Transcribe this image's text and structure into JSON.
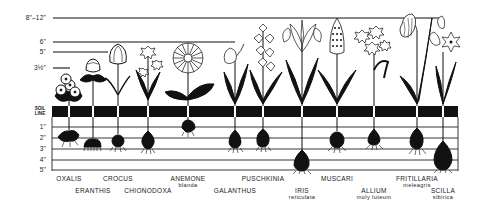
{
  "diagram": {
    "height_markers": [
      {
        "label": "8\"–12\"",
        "y": 18,
        "x_end": 443
      },
      {
        "label": "6\"",
        "y": 42,
        "x_end": 235
      },
      {
        "label": "5\"",
        "y": 52,
        "x_end": 108
      },
      {
        "label": "3½\"",
        "y": 68,
        "x_end": 70
      }
    ],
    "soil_line": {
      "label_line1": "SOIL",
      "label_line2": "LINE"
    },
    "depth_markers": [
      {
        "label": "1\"",
        "y": 127
      },
      {
        "label": "2\"",
        "y": 138
      },
      {
        "label": "3\"",
        "y": 149
      },
      {
        "label": "4\"",
        "y": 160
      },
      {
        "label": "5\"",
        "y": 170
      }
    ],
    "plants": [
      {
        "name": "OXALIS",
        "sub": "",
        "x": 69,
        "label_row": 1
      },
      {
        "name": "ERANTHIS",
        "sub": "",
        "x": 93,
        "label_row": 2
      },
      {
        "name": "CROCUS",
        "sub": "",
        "x": 118,
        "label_row": 1
      },
      {
        "name": "CHIONODOXA",
        "sub": "",
        "x": 148,
        "label_row": 2
      },
      {
        "name": "ANEMONE",
        "sub": "blanda",
        "x": 188,
        "label_row": 1
      },
      {
        "name": "GALANTHUS",
        "sub": "",
        "x": 235,
        "label_row": 2
      },
      {
        "name": "PUSCHKINIA",
        "sub": "",
        "x": 263,
        "label_row": 1
      },
      {
        "name": "IRIS",
        "sub": "reticulata",
        "x": 302,
        "label_row": 2
      },
      {
        "name": "MUSCARI",
        "sub": "",
        "x": 337,
        "label_row": 1
      },
      {
        "name": "ALLIUM",
        "sub": "moly luteum",
        "x": 374,
        "label_row": 2
      },
      {
        "name": "FRITILLARIA",
        "sub": "meleagris",
        "x": 417,
        "label_row": 1
      },
      {
        "name": "SCILLA",
        "sub": "sibirica",
        "x": 443,
        "label_row": 2
      }
    ],
    "colors": {
      "ink": "#111111",
      "paper": "#ffffff"
    }
  }
}
